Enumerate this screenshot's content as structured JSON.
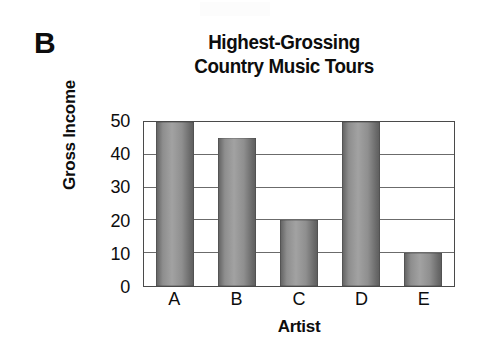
{
  "panel": {
    "label": "B"
  },
  "chart_data": {
    "type": "bar",
    "title": "Highest-Grossing Country Music Tours",
    "title_lines": [
      "Highest-Grossing",
      "Country Music Tours"
    ],
    "xlabel": "Artist",
    "ylabel": "Gross Income",
    "categories": [
      "A",
      "B",
      "C",
      "D",
      "E"
    ],
    "values": [
      50,
      45,
      20,
      50,
      10
    ],
    "ylim": [
      0,
      50
    ],
    "yticks": [
      0,
      10,
      20,
      30,
      40,
      50
    ],
    "ytick_labels": [
      "0",
      "10",
      "20",
      "30",
      "40",
      "50"
    ],
    "grid": true,
    "grid_axis": "y",
    "legend": null,
    "bar_color": "#8e8e8e",
    "axis_color": "#4a4a4a",
    "text_color": "#0d0d0d",
    "background": "#ffffff"
  }
}
